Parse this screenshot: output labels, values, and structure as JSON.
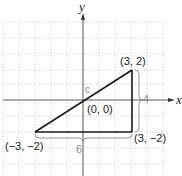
{
  "diagram": {
    "type": "coordinate-plane-right-triangle",
    "axes": {
      "x_label": "x",
      "y_label": "y"
    },
    "grid": {
      "x_range": [
        -5,
        5
      ],
      "y_range": [
        -4,
        4
      ],
      "unit": 1
    },
    "vertices": [
      {
        "id": "top",
        "label": "(3, 2)",
        "x": 3,
        "y": 2
      },
      {
        "id": "bottom-right",
        "label": "(3, −2)",
        "x": 3,
        "y": -2
      },
      {
        "id": "bottom-left",
        "label": "(−3, −2)",
        "x": -3,
        "y": -2
      }
    ],
    "origin_label": "(0, 0)",
    "hypotenuse_label": "c",
    "vertical_leg_length": "4",
    "horizontal_leg_length": "6",
    "colors": {
      "line": "#1a1a1a",
      "grid": "#b0b0b0",
      "brace": "#8a8a8a"
    }
  }
}
